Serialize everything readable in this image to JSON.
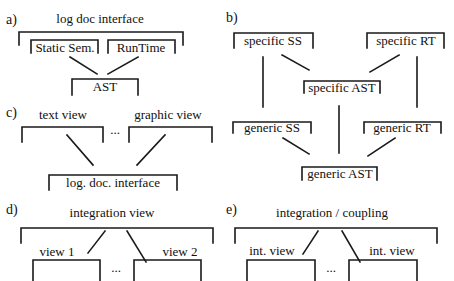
{
  "panels": {
    "a": {
      "label": "a)",
      "top": "log doc interface",
      "children": [
        "Static Sem.",
        "RunTime"
      ],
      "base": "AST"
    },
    "b": {
      "label": "b)",
      "specific_ss": "specific SS",
      "specific_rt": "specific RT",
      "specific_ast": "specific AST",
      "generic_ss": "generic SS",
      "generic_rt": "generic RT",
      "generic_ast": "generic AST"
    },
    "c": {
      "label": "c)",
      "views": [
        "text view",
        "graphic view"
      ],
      "ellipsis": "...",
      "base": "log. doc. interface"
    },
    "d": {
      "label": "d)",
      "top": "integration view",
      "views": [
        "view 1",
        "view 2"
      ],
      "ellipsis": "..."
    },
    "e": {
      "label": "e)",
      "top": "integration / coupling",
      "views": [
        "int. view",
        "int. view"
      ],
      "ellipsis": "..."
    }
  },
  "colors": {
    "line": "#1a1a1a",
    "text": "#111111",
    "background": "#ffffff"
  }
}
